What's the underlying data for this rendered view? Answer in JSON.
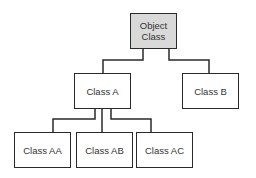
{
  "diagram": {
    "type": "class-hierarchy-tree",
    "colors": {
      "line": "#2a2a2a",
      "root_fill": "#d9d9d9",
      "node_fill": "#ffffff",
      "text": "#333333"
    },
    "nodes": {
      "root": {
        "label": "Object\nClass"
      },
      "class_a": {
        "label": "Class A"
      },
      "class_b": {
        "label": "Class B"
      },
      "class_aa": {
        "label": "Class AA"
      },
      "class_ab": {
        "label": "Class AB"
      },
      "class_ac": {
        "label": "Class AC"
      }
    },
    "edges": [
      {
        "from": "Object Class",
        "to": "Class A"
      },
      {
        "from": "Object Class",
        "to": "Class B"
      },
      {
        "from": "Class A",
        "to": "Class AA"
      },
      {
        "from": "Class A",
        "to": "Class AB"
      },
      {
        "from": "Class A",
        "to": "Class AC"
      }
    ]
  }
}
